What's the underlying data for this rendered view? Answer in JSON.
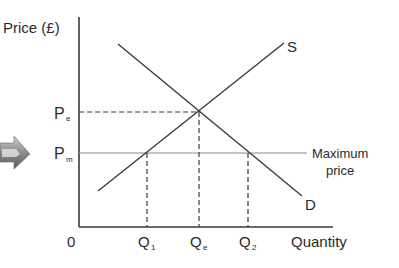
{
  "diagram": {
    "type": "supply-demand-maximum-price",
    "y_axis_label": "Price (£)",
    "x_axis_label": "Quantity",
    "origin_label": "0",
    "price_labels": {
      "equilibrium": {
        "main": "P",
        "sub": "e"
      },
      "maximum": {
        "main": "P",
        "sub": "m"
      }
    },
    "quantity_labels": {
      "q1": {
        "main": "Q",
        "sub": "1"
      },
      "qe": {
        "main": "Q",
        "sub": "e"
      },
      "q2": {
        "main": "Q",
        "sub": "2"
      }
    },
    "curve_labels": {
      "supply": "S",
      "demand": "D"
    },
    "max_price_line_label": {
      "line1": "Maximum",
      "line2": "price"
    },
    "left_arrow_icon": "arrow-right-icon"
  },
  "colors": {
    "lines": "#3a3a3a",
    "max_price_line": "#8a8a8a",
    "text": "#2a2a2a",
    "arrow_fill": "#9a9a9a"
  }
}
